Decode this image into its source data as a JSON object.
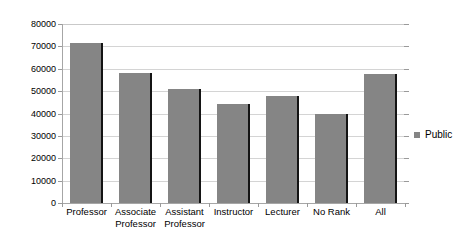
{
  "chart_data": {
    "type": "bar",
    "title": "",
    "xlabel": "",
    "ylabel": "",
    "categories": [
      "Professor",
      "Associate Professor",
      "Assistant Professor",
      "Instructor",
      "Lecturer",
      "No Rank",
      "All"
    ],
    "category_lines": [
      [
        "Professor"
      ],
      [
        "Associate",
        "Professor"
      ],
      [
        "Assistant",
        "Professor"
      ],
      [
        "Instructor"
      ],
      [
        "Lecturer"
      ],
      [
        "No Rank"
      ],
      [
        "All"
      ]
    ],
    "series": [
      {
        "name": "Public",
        "values": [
          71500,
          58000,
          50800,
          44300,
          48000,
          40000,
          57800
        ],
        "color": "#858585"
      }
    ],
    "ylim": [
      0,
      80000
    ],
    "ytick_values": [
      0,
      10000,
      20000,
      30000,
      40000,
      50000,
      60000,
      70000,
      80000
    ],
    "ytick_labels": [
      "0",
      "10000",
      "20000",
      "30000",
      "40000",
      "50000",
      "60000",
      "70000",
      "80000"
    ],
    "grid": true,
    "grid_color": "#d4d4d4",
    "legend_position": "right",
    "legend_entries": [
      {
        "label": "Public",
        "color": "#858585",
        "marker": "square"
      }
    ],
    "background_color": "#ffffff",
    "axis_color": "#a6a6a6"
  }
}
